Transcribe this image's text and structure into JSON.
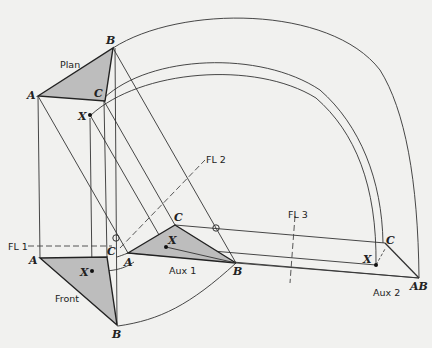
{
  "views": {
    "plan": {
      "label": "Plan",
      "A": "A",
      "B": "B",
      "C": "C",
      "X": "X"
    },
    "front": {
      "label": "Front",
      "A": "A",
      "B": "B",
      "C": "C",
      "X": "X"
    },
    "aux1": {
      "label": "Aux 1",
      "A": "A",
      "B": "B",
      "C": "C",
      "X": "X"
    },
    "aux2": {
      "label": "Aux 2",
      "C": "C",
      "X": "X",
      "AB": "AB"
    }
  },
  "fold_lines": {
    "fl1": "FL 1",
    "fl2": "FL 2",
    "fl3": "FL 3"
  },
  "colors": {
    "line": "#333333",
    "fill": "#bdbdbd",
    "background": "#f1f1ef"
  }
}
